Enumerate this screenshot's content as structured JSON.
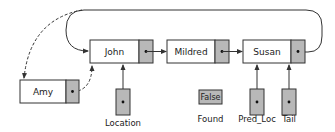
{
  "diagram": {
    "type": "linked-list-insertion",
    "nodes": [
      {
        "id": "john",
        "label": "John"
      },
      {
        "id": "mildred",
        "label": "Mildred"
      },
      {
        "id": "susan",
        "label": "Susan"
      },
      {
        "id": "amy",
        "label": "Amy"
      }
    ],
    "variables": [
      {
        "id": "location",
        "label": "Location",
        "points_to": "john"
      },
      {
        "id": "found",
        "label": "Found",
        "value": "False"
      },
      {
        "id": "pred_loc",
        "label": "Pred_Loc",
        "points_to": "susan"
      },
      {
        "id": "tail",
        "label": "Tail",
        "points_to": "susan"
      }
    ],
    "edges": [
      {
        "from": "john",
        "to": "mildred",
        "style": "solid"
      },
      {
        "from": "mildred",
        "to": "susan",
        "style": "solid"
      },
      {
        "from": "susan",
        "to": "john",
        "style": "solid",
        "note": "circular wrap-around"
      },
      {
        "from": "susan",
        "to": "amy",
        "style": "dashed"
      },
      {
        "from": "amy",
        "to": "john",
        "style": "dashed"
      }
    ],
    "colors": {
      "pointer_fill": "#b8b8b8",
      "node_fill": "#ffffff",
      "stroke": "#333333"
    }
  }
}
